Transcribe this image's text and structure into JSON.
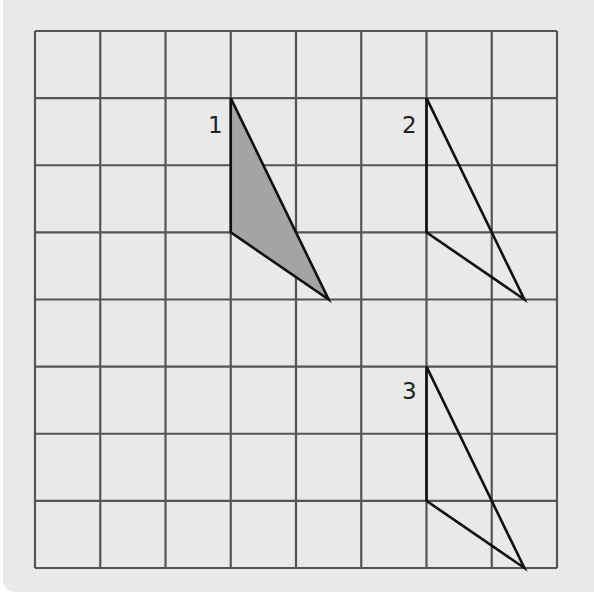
{
  "figure": {
    "grid": {
      "columns": 8,
      "rows": 8,
      "line_color": "#555555",
      "background": "#e9e9e9"
    },
    "shapes": [
      {
        "id": 1,
        "label": "1",
        "filled": true,
        "fill_color": "#a4a4a4",
        "vertices_grid": [
          [
            3,
            1
          ],
          [
            3,
            3
          ],
          [
            4.5,
            4
          ]
        ]
      },
      {
        "id": 2,
        "label": "2",
        "filled": false,
        "vertices_grid": [
          [
            6,
            1
          ],
          [
            6,
            3
          ],
          [
            7.5,
            4
          ]
        ]
      },
      {
        "id": 3,
        "label": "3",
        "filled": false,
        "vertices_grid": [
          [
            6,
            5
          ],
          [
            6,
            7
          ],
          [
            7.5,
            8
          ]
        ]
      }
    ]
  }
}
